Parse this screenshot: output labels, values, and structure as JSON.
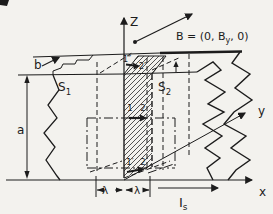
{
  "figure": {
    "background": "#f3f2ee",
    "ink_color": "#1c1c1c",
    "axes": {
      "z": "Z",
      "y": "y",
      "x": "x"
    },
    "field": {
      "prefix": "B = (0, B",
      "sub": "y",
      "suffix": ", 0)"
    },
    "dims": {
      "b": "b",
      "a": "a",
      "lambda_left": "λ",
      "lambda_right": "λ"
    },
    "surfaces": {
      "s1": {
        "main": "S",
        "sub": "1"
      },
      "s2": {
        "main": "S",
        "sub": "2"
      }
    },
    "current": {
      "main": "I",
      "sub": "s"
    },
    "points": {
      "p1": "1",
      "p2": "2",
      "p1_prime": "1′",
      "p2_prime": "2′",
      "p1_dprime": "1″",
      "p2_dprime": "2″"
    }
  }
}
